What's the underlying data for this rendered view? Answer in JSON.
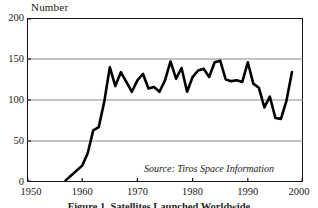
{
  "chart_data": {
    "type": "line",
    "title": "",
    "ylabel": "Number",
    "xlabel": "",
    "source_note": "Source: Tiros Space Information",
    "caption": "Figure 1. Satellites Launched Worldwide",
    "xlim": [
      1950,
      2000
    ],
    "ylim": [
      0,
      200
    ],
    "xticks": [
      1950,
      1960,
      1970,
      1980,
      1990,
      2000
    ],
    "yticks": [
      0,
      50,
      100,
      150,
      200
    ],
    "gridlines": {
      "horizontal_at": [
        50,
        100,
        150
      ],
      "vertical": false
    },
    "legend": null,
    "series": [
      {
        "name": "Satellites launched",
        "color": "#000000",
        "x": [
          1957,
          1958,
          1959,
          1960,
          1961,
          1962,
          1963,
          1964,
          1965,
          1966,
          1967,
          1968,
          1969,
          1970,
          1971,
          1972,
          1973,
          1974,
          1975,
          1976,
          1977,
          1978,
          1979,
          1980,
          1981,
          1982,
          1983,
          1984,
          1985,
          1986,
          1987,
          1988,
          1989,
          1990,
          1991,
          1992,
          1993,
          1994,
          1995,
          1996,
          1997,
          1998
        ],
        "values": [
          2,
          8,
          14,
          20,
          35,
          63,
          67,
          98,
          140,
          117,
          134,
          122,
          110,
          124,
          132,
          114,
          116,
          110,
          124,
          147,
          126,
          139,
          110,
          128,
          136,
          138,
          128,
          146,
          148,
          125,
          123,
          124,
          122,
          146,
          120,
          115,
          91,
          104,
          78,
          77,
          99,
          134
        ]
      }
    ]
  },
  "axis_title": "Number",
  "source_note": "Source: Tiros Space Information",
  "caption": "Figure 1. Satellites Launched Worldwide",
  "colors": {
    "line": "#000000",
    "frame": "#141414",
    "grid": "#8a8a8a",
    "background": "#ffffff",
    "text": "#1a1a1a"
  }
}
